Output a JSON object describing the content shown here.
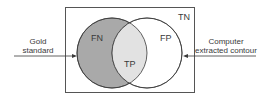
{
  "diagram": {
    "type": "venn",
    "regions": {
      "fn": "FN",
      "tp": "TP",
      "fp": "FP",
      "tn": "TN"
    },
    "left_input": {
      "line1": "Gold",
      "line2": "standard"
    },
    "right_input": {
      "line1": "Computer",
      "line2": "extracted contour"
    },
    "colors": {
      "fn_fill": "#a9a9a9",
      "tp_fill": "#e2e2e2",
      "fp_fill": "#ffffff",
      "stroke": "#3a3a3a",
      "box_stroke": "#555555"
    }
  }
}
